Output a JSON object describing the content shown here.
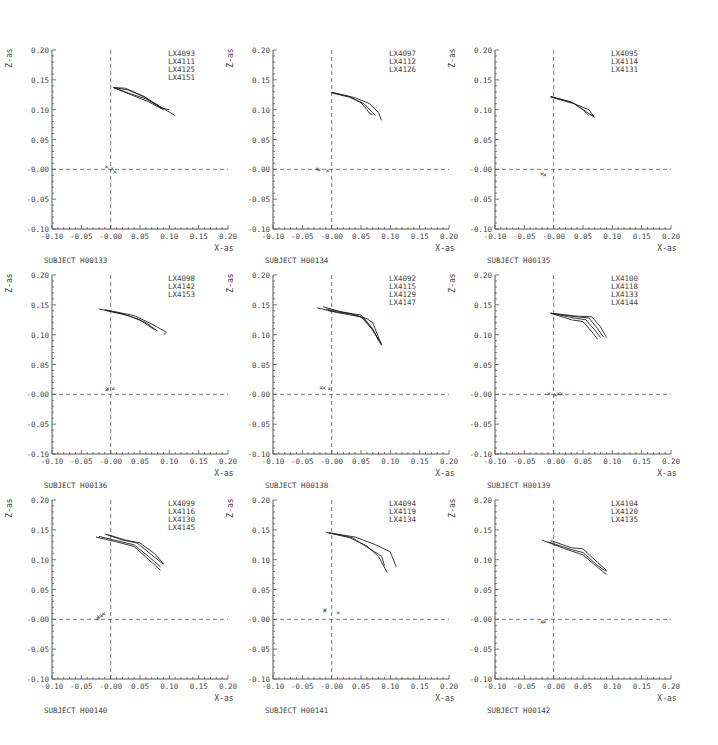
{
  "figure": {
    "axis_xlabel": "X-as",
    "axis_ylabel": "Z-as",
    "x_ticks": [
      "-0.10",
      "-0.05",
      "-0.00",
      "0.05",
      "0.10",
      "0.15",
      "0.20"
    ],
    "y_ticks": [
      "0.20",
      "0.15",
      "0.10",
      "0.05",
      "-0.00",
      "-0.05",
      "-0.10"
    ],
    "line_color": "#222222",
    "axis_color": "#555555"
  },
  "chart_data": [
    {
      "type": "line",
      "title": "SUBJECT H00133",
      "xlabel": "X-as",
      "ylabel": "Z-as",
      "xlim": [
        -0.1,
        0.2
      ],
      "ylim": [
        -0.1,
        0.2
      ],
      "legend": [
        "LX4093",
        "LX4111",
        "LX4125",
        "LX4151"
      ],
      "series": [
        {
          "name": "LX4093",
          "x": [
            0.005,
            0.03,
            0.06,
            0.09,
            0.11
          ],
          "y": [
            0.137,
            0.128,
            0.118,
            0.102,
            0.09
          ]
        },
        {
          "name": "LX4111",
          "x": [
            0.005,
            0.035,
            0.065,
            0.09
          ],
          "y": [
            0.137,
            0.125,
            0.113,
            0.1
          ]
        },
        {
          "name": "LX4125",
          "x": [
            0.005,
            0.03,
            0.06,
            0.085,
            0.1
          ],
          "y": [
            0.137,
            0.133,
            0.12,
            0.103,
            0.1
          ]
        },
        {
          "name": "LX4151",
          "x": [
            0.005,
            0.025,
            0.055,
            0.08,
            0.09
          ],
          "y": [
            0.137,
            0.136,
            0.123,
            0.108,
            0.1
          ]
        }
      ],
      "markers": [
        {
          "x": -0.007,
          "y": 0.005
        },
        {
          "x": 0.003,
          "y": 0.003
        },
        {
          "x": 0.007,
          "y": -0.002
        }
      ]
    },
    {
      "type": "line",
      "title": "SUBJECT H00134",
      "xlabel": "X-as",
      "ylabel": "Z-as",
      "xlim": [
        -0.1,
        0.2
      ],
      "ylim": [
        -0.1,
        0.2
      ],
      "legend": [
        "LX4097",
        "LX4112",
        "LX4126"
      ],
      "series": [
        {
          "name": "LX4097",
          "x": [
            0.0,
            0.03,
            0.05,
            0.06,
            0.065,
            0.07
          ],
          "y": [
            0.129,
            0.122,
            0.112,
            0.1,
            0.093,
            0.092
          ]
        },
        {
          "name": "LX4112",
          "x": [
            0.0,
            0.03,
            0.055,
            0.07,
            0.075
          ],
          "y": [
            0.128,
            0.121,
            0.11,
            0.095,
            0.09
          ]
        },
        {
          "name": "LX4126",
          "x": [
            0.0,
            0.04,
            0.065,
            0.08,
            0.085
          ],
          "y": [
            0.129,
            0.12,
            0.11,
            0.095,
            0.082
          ]
        }
      ],
      "markers": [
        {
          "x": -0.025,
          "y": 0.002
        },
        {
          "x": -0.022,
          "y": 0.001
        },
        {
          "x": -0.007,
          "y": -0.001
        }
      ]
    },
    {
      "type": "line",
      "title": "SUBJECT H00135",
      "xlabel": "X-as",
      "ylabel": "Z-as",
      "xlim": [
        -0.1,
        0.2
      ],
      "ylim": [
        -0.1,
        0.2
      ],
      "legend": [
        "LX4095",
        "LX4114",
        "LX4131"
      ],
      "series": [
        {
          "name": "LX4095",
          "x": [
            -0.005,
            0.03,
            0.05,
            0.06
          ],
          "y": [
            0.122,
            0.113,
            0.1,
            0.09
          ]
        },
        {
          "name": "LX4114",
          "x": [
            -0.005,
            0.035,
            0.055,
            0.07
          ],
          "y": [
            0.121,
            0.11,
            0.097,
            0.087
          ]
        },
        {
          "name": "LX4131",
          "x": [
            -0.005,
            0.03,
            0.06,
            0.068,
            0.062
          ],
          "y": [
            0.122,
            0.112,
            0.1,
            0.089,
            0.092
          ]
        }
      ],
      "markers": [
        {
          "x": -0.02,
          "y": -0.006
        },
        {
          "x": -0.015,
          "y": -0.008
        }
      ]
    },
    {
      "type": "line",
      "title": "SUBJECT H00136",
      "xlabel": "X-as",
      "ylabel": "Z-as",
      "xlim": [
        -0.1,
        0.2
      ],
      "ylim": [
        -0.1,
        0.2
      ],
      "legend": [
        "LX4098",
        "LX4142",
        "LX4153"
      ],
      "series": [
        {
          "name": "LX4098",
          "x": [
            -0.02,
            0.02,
            0.05,
            0.075
          ],
          "y": [
            0.143,
            0.135,
            0.125,
            0.108
          ]
        },
        {
          "name": "LX4142",
          "x": [
            -0.01,
            0.03,
            0.06,
            0.08
          ],
          "y": [
            0.141,
            0.132,
            0.12,
            0.106
          ]
        },
        {
          "name": "LX4153",
          "x": [
            -0.01,
            0.04,
            0.07,
            0.095,
            0.09
          ],
          "y": [
            0.142,
            0.132,
            0.118,
            0.104,
            0.1
          ]
        }
      ],
      "markers": [
        {
          "x": -0.007,
          "y": 0.009
        },
        {
          "x": -0.005,
          "y": 0.01
        },
        {
          "x": 0.004,
          "y": 0.01
        }
      ]
    },
    {
      "type": "line",
      "title": "SUBJECT H00138",
      "xlabel": "X-as",
      "ylabel": "Z-as",
      "xlim": [
        -0.1,
        0.2
      ],
      "ylim": [
        -0.1,
        0.2
      ],
      "legend": [
        "LX4092",
        "LX4115",
        "LX4129",
        "LX4147"
      ],
      "series": [
        {
          "name": "LX4092",
          "x": [
            -0.025,
            0.01,
            0.05,
            0.07,
            0.085
          ],
          "y": [
            0.145,
            0.137,
            0.13,
            0.108,
            0.082
          ]
        },
        {
          "name": "LX4115",
          "x": [
            -0.015,
            0.02,
            0.05,
            0.065,
            0.085
          ],
          "y": [
            0.147,
            0.137,
            0.133,
            0.115,
            0.085
          ]
        },
        {
          "name": "LX4129",
          "x": [
            -0.01,
            0.03,
            0.055,
            0.07,
            0.08
          ],
          "y": [
            0.143,
            0.136,
            0.128,
            0.11,
            0.09
          ]
        },
        {
          "name": "LX4147",
          "x": [
            -0.005,
            0.03,
            0.06,
            0.07,
            0.085
          ],
          "y": [
            0.14,
            0.135,
            0.127,
            0.12,
            0.083
          ]
        }
      ],
      "markers": [
        {
          "x": -0.018,
          "y": 0.012
        },
        {
          "x": -0.013,
          "y": 0.012
        },
        {
          "x": -0.004,
          "y": 0.01
        }
      ]
    },
    {
      "type": "line",
      "title": "SUBJECT H00139",
      "xlabel": "X-as",
      "ylabel": "Z-as",
      "xlim": [
        -0.1,
        0.2
      ],
      "ylim": [
        -0.1,
        0.2
      ],
      "legend": [
        "LX4100",
        "LX4118",
        "LX4133",
        "LX4144"
      ],
      "series": [
        {
          "name": "LX4100",
          "x": [
            -0.005,
            0.03,
            0.05,
            0.065,
            0.075
          ],
          "y": [
            0.136,
            0.125,
            0.122,
            0.105,
            0.092
          ]
        },
        {
          "name": "LX4118",
          "x": [
            -0.005,
            0.035,
            0.055,
            0.07,
            0.08
          ],
          "y": [
            0.136,
            0.128,
            0.125,
            0.108,
            0.095
          ]
        },
        {
          "name": "LX4133",
          "x": [
            -0.005,
            0.04,
            0.06,
            0.075,
            0.085
          ],
          "y": [
            0.136,
            0.13,
            0.128,
            0.11,
            0.096
          ]
        },
        {
          "name": "LX4144",
          "x": [
            -0.005,
            0.04,
            0.065,
            0.08,
            0.09
          ],
          "y": [
            0.136,
            0.131,
            0.13,
            0.113,
            0.095
          ]
        }
      ],
      "markers": [
        {
          "x": -0.008,
          "y": 0.002
        },
        {
          "x": 0.003,
          "y": 0.001
        },
        {
          "x": 0.008,
          "y": 0.002
        },
        {
          "x": 0.013,
          "y": 0.002
        }
      ]
    },
    {
      "type": "line",
      "title": "SUBJECT H00140",
      "xlabel": "X-as",
      "ylabel": "Z-as",
      "xlim": [
        -0.1,
        0.2
      ],
      "ylim": [
        -0.1,
        0.2
      ],
      "legend": [
        "LX4099",
        "LX4116",
        "LX4130",
        "LX4145"
      ],
      "series": [
        {
          "name": "LX4099",
          "x": [
            -0.025,
            0.01,
            0.04,
            0.065,
            0.085
          ],
          "y": [
            0.138,
            0.13,
            0.122,
            0.1,
            0.082
          ]
        },
        {
          "name": "LX4116",
          "x": [
            -0.02,
            0.01,
            0.04,
            0.065,
            0.085
          ],
          "y": [
            0.139,
            0.132,
            0.125,
            0.105,
            0.088
          ]
        },
        {
          "name": "LX4130",
          "x": [
            -0.01,
            0.02,
            0.045,
            0.07,
            0.09
          ],
          "y": [
            0.143,
            0.133,
            0.128,
            0.108,
            0.092
          ]
        },
        {
          "name": "LX4145",
          "x": [
            -0.005,
            0.025,
            0.05,
            0.075,
            0.09
          ],
          "y": [
            0.142,
            0.133,
            0.128,
            0.11,
            0.093
          ]
        }
      ],
      "markers": [
        {
          "x": -0.022,
          "y": 0.003
        },
        {
          "x": -0.021,
          "y": 0.006
        },
        {
          "x": -0.016,
          "y": 0.008
        },
        {
          "x": -0.012,
          "y": 0.01
        }
      ]
    },
    {
      "type": "line",
      "title": "SUBJECT H00141",
      "xlabel": "X-as",
      "ylabel": "Z-as",
      "xlim": [
        -0.1,
        0.2
      ],
      "ylim": [
        -0.1,
        0.2
      ],
      "legend": [
        "LX4094",
        "LX4119",
        "LX4134"
      ],
      "series": [
        {
          "name": "LX4094",
          "x": [
            -0.01,
            0.03,
            0.06,
            0.08,
            0.095
          ],
          "y": [
            0.146,
            0.137,
            0.123,
            0.105,
            0.078
          ]
        },
        {
          "name": "LX4119",
          "x": [
            -0.005,
            0.035,
            0.065,
            0.085,
            0.09
          ],
          "y": [
            0.145,
            0.137,
            0.118,
            0.106,
            0.09
          ]
        },
        {
          "name": "LX4134",
          "x": [
            -0.005,
            0.04,
            0.075,
            0.1,
            0.11
          ],
          "y": [
            0.145,
            0.138,
            0.125,
            0.113,
            0.088
          ]
        }
      ],
      "markers": [
        {
          "x": -0.012,
          "y": 0.015
        },
        {
          "x": -0.011,
          "y": 0.017
        },
        {
          "x": 0.011,
          "y": 0.013
        }
      ]
    },
    {
      "type": "line",
      "title": "SUBJECT H00142",
      "xlabel": "X-as",
      "ylabel": "Z-as",
      "xlim": [
        -0.1,
        0.2
      ],
      "ylim": [
        -0.1,
        0.2
      ],
      "legend": [
        "LX4104",
        "LX4120",
        "LX4135"
      ],
      "series": [
        {
          "name": "LX4104",
          "x": [
            -0.02,
            0.02,
            0.05,
            0.075,
            0.09
          ],
          "y": [
            0.133,
            0.118,
            0.108,
            0.087,
            0.075
          ]
        },
        {
          "name": "LX4120",
          "x": [
            -0.01,
            0.03,
            0.05,
            0.075,
            0.09
          ],
          "y": [
            0.13,
            0.117,
            0.112,
            0.09,
            0.08
          ]
        },
        {
          "name": "LX4135",
          "x": [
            -0.005,
            0.03,
            0.05,
            0.075,
            0.09
          ],
          "y": [
            0.132,
            0.12,
            0.118,
            0.095,
            0.082
          ]
        }
      ],
      "markers": [
        {
          "x": -0.02,
          "y": -0.003
        },
        {
          "x": -0.016,
          "y": -0.002
        }
      ]
    }
  ]
}
